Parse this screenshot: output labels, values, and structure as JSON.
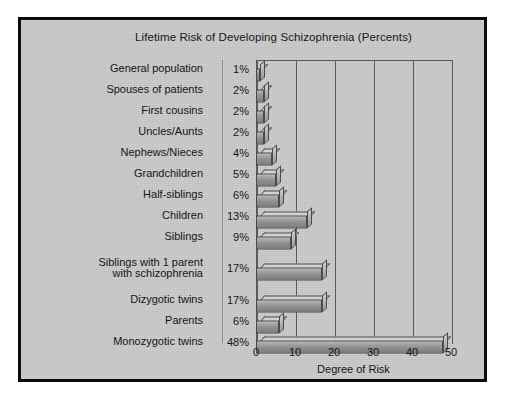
{
  "figure": {
    "title": "Lifetime Risk of Developing Schizophrenia (Percents)",
    "background_color": "#c9c9c9",
    "frame_color": "#0c0c0c",
    "text_color": "#151515",
    "bar_color": "#9b9b9b"
  },
  "chart_data": {
    "type": "bar",
    "orientation": "horizontal",
    "title": "Lifetime Risk of Developing Schizophrenia (Percents)",
    "xlabel": "Degree of Risk",
    "ylabel": "",
    "xlim": [
      0,
      50
    ],
    "xticks": [
      0,
      10,
      20,
      30,
      40,
      50
    ],
    "xtick_labels": [
      "0",
      "10",
      "20",
      "30",
      "40",
      "50"
    ],
    "grid": "vertical",
    "legend": "none",
    "categories": [
      "General population",
      "Spouses of patients",
      "First cousins",
      "Uncles/Aunts",
      "Nephews/Nieces",
      "Grandchildren",
      "Half-siblings",
      "Children",
      "Siblings",
      "Siblings with 1 parent\nwith schizophrenia",
      "Dizygotic twins",
      "Parents",
      "Monozygotic twins"
    ],
    "values": [
      1,
      2,
      2,
      2,
      4,
      5,
      6,
      13,
      9,
      17,
      17,
      6,
      48
    ],
    "value_labels": [
      "1%",
      "2%",
      "2%",
      "2%",
      "4%",
      "5%",
      "6%",
      "13%",
      "9%",
      "17%",
      "17%",
      "6%",
      "48%"
    ]
  }
}
